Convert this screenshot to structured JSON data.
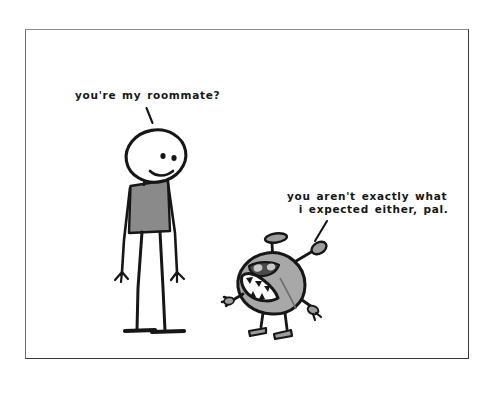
{
  "scene": {
    "title": "stick figure and monster roommate cartoon",
    "background_color": "#ffffff",
    "frame_color": "#3a3a3d",
    "ink_color": "#161616",
    "width": 493,
    "height": 397
  },
  "captions": {
    "roommate": "you're my roommate?",
    "expected_line1": "you aren't exactly what",
    "expected_line2": "i expected either, pal.",
    "expected_full": "you aren't exactly what\n  i expected either, pal."
  },
  "characters": {
    "stick_figure": {
      "name": "stick figure man",
      "shirt_color": "#8a8a8a",
      "skin_color": "#ffffff",
      "expression": "frowning",
      "speaks": "you're my roommate?"
    },
    "monster": {
      "name": "round antenna monster",
      "body_color": "#a8a8a8",
      "detail_color": "#8f8f8f",
      "expression": "angry open mouth with jagged teeth",
      "antennae": 2,
      "arms": 2,
      "legs": 2,
      "speaks": "you aren't exactly what i expected either, pal."
    }
  }
}
